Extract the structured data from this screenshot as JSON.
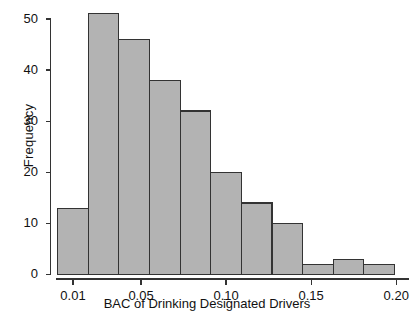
{
  "chart_data": {
    "type": "bar",
    "title": "",
    "subtitle": "",
    "xlabel": "BAC of Drinking Designated Drivers",
    "ylabel": "Frequency",
    "bin_width": 0.018,
    "bin_starts": [
      0.001,
      0.019,
      0.037,
      0.055,
      0.073,
      0.091,
      0.109,
      0.127,
      0.145,
      0.163,
      0.181
    ],
    "bin_ends": [
      0.019,
      0.037,
      0.055,
      0.073,
      0.091,
      0.109,
      0.127,
      0.145,
      0.163,
      0.181,
      0.199
    ],
    "categories": [
      "0.001-0.019",
      "0.019-0.037",
      "0.037-0.055",
      "0.055-0.073",
      "0.073-0.091",
      "0.091-0.109",
      "0.109-0.127",
      "0.127-0.145",
      "0.145-0.163",
      "0.163-0.181",
      "0.181-0.199"
    ],
    "values": [
      13,
      51,
      46,
      38,
      32,
      20,
      14,
      10,
      2,
      3,
      2
    ],
    "xlim": [
      0.0,
      0.2075
    ],
    "ylim": [
      0,
      52
    ],
    "xticks": [
      0.01,
      0.05,
      0.1,
      0.15,
      0.2
    ],
    "xtick_labels": [
      "0.01",
      "0.05",
      "0.10",
      "0.15",
      "0.20"
    ],
    "yticks": [
      0,
      10,
      20,
      30,
      40,
      50
    ],
    "ytick_labels": [
      "0",
      "10",
      "20",
      "30",
      "40",
      "50"
    ],
    "grid": false,
    "legend": null,
    "bar_fill": "#b3b3b3",
    "bar_stroke": "#333333",
    "axis_color": "#333333"
  }
}
